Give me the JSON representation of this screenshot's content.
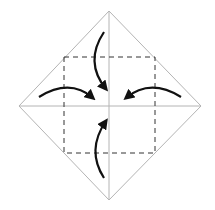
{
  "diagram": {
    "type": "origami-fold-step",
    "colors": {
      "background": "#ffffff",
      "crease": "#b4b4b4",
      "fold_line": "#333333",
      "arrow": "#111111"
    },
    "outline": [
      [
        109,
        11
      ],
      [
        201,
        106
      ],
      [
        109,
        200
      ],
      [
        19,
        106
      ]
    ],
    "creases": [
      {
        "name": "vertical-crease",
        "from": [
          109,
          11
        ],
        "to": [
          109,
          200
        ]
      },
      {
        "name": "horizontal-crease",
        "from": [
          19,
          106
        ],
        "to": [
          201,
          106
        ]
      }
    ],
    "valley_fold_square": {
      "x": 64,
      "y": 57,
      "w": 91,
      "h": 96
    },
    "arrows": [
      {
        "name": "top-corner-arrow",
        "path": "M104,32 Q 84,62 106,89"
      },
      {
        "name": "left-corner-arrow",
        "path": "M39,97 Q 70,78 93,98"
      },
      {
        "name": "right-corner-arrow",
        "path": "M181,97 Q 150,78 126,98"
      },
      {
        "name": "bottom-corner-arrow",
        "path": "M104,178 Q 86,150 106,121"
      }
    ]
  }
}
